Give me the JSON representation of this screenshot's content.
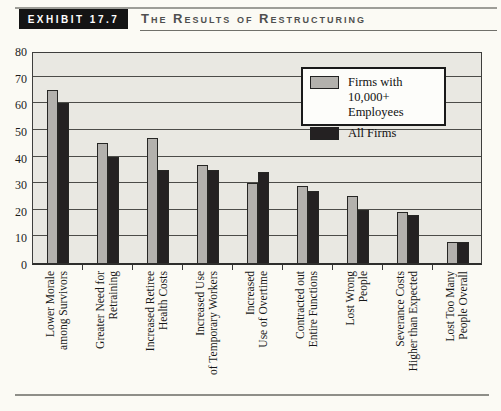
{
  "header": {
    "exhibit_label": "EXHIBIT 17.7",
    "title": "The Results of Restructuring"
  },
  "colors": {
    "page_bg": "#fbfaf4",
    "plot_bg": "#e9e8e2",
    "bar_large_firms": "#b3b1ad",
    "bar_all_firms": "#242122",
    "tag_bg": "#141414",
    "tag_text": "#ffffff"
  },
  "chart_data": {
    "type": "bar",
    "title": "The Results of Restructuring",
    "categories": [
      "Lower Morale among Survivors",
      "Greater Need for Retraining",
      "Increased Retiree Health Costs",
      "Increased Use of Temporary Workers",
      "Increased Use of Overtime",
      "Contracted out Entire Functions",
      "Lost Wrong People",
      "Severance Costs Higher than Expected",
      "Lost Too Many People Overall"
    ],
    "category_label_lines": [
      [
        "Lower Morale",
        "among Survivors"
      ],
      [
        "Greater Need for",
        "Retraining"
      ],
      [
        "Increased Retiree",
        "Health Costs"
      ],
      [
        "Increased Use",
        "of Temporary Workers"
      ],
      [
        "Increased",
        "Use of Overtime"
      ],
      [
        "Contracted out",
        "Entire Functions"
      ],
      [
        "Lost Wrong",
        "People"
      ],
      [
        "Severance Costs",
        "Higher than Expected"
      ],
      [
        "Lost Too Many",
        "People Overall"
      ]
    ],
    "series": [
      {
        "name": "Firms with 10,000+ Employees",
        "color": "#b3b1ad",
        "values": [
          65,
          45,
          47,
          37,
          30,
          29,
          25,
          19,
          8
        ]
      },
      {
        "name": "All Firms",
        "color": "#242122",
        "values": [
          60,
          40,
          35,
          35,
          34,
          27,
          20,
          18,
          8
        ]
      }
    ],
    "xlabel": "",
    "ylabel": "",
    "ylim": [
      0,
      80
    ],
    "yticks": [
      0,
      10,
      20,
      30,
      40,
      50,
      60,
      70,
      80
    ],
    "grid": true,
    "legend_position": "top-right"
  }
}
